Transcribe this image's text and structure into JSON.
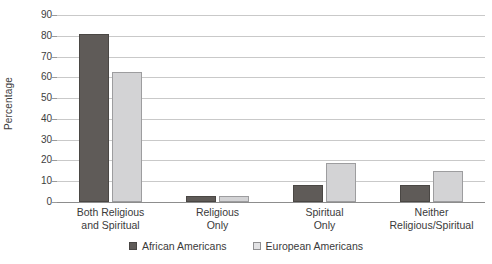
{
  "chart_data": {
    "type": "bar",
    "title": "",
    "xlabel": "",
    "ylabel": "Percentage",
    "ylim": [
      0,
      90
    ],
    "ytick_step": 10,
    "yticks": [
      "90",
      "80",
      "70",
      "60",
      "50",
      "40",
      "30",
      "20",
      "10",
      "0"
    ],
    "grid": true,
    "legend_position": "bottom",
    "categories": [
      "Both Religious\nand Spiritual",
      "Religious\nOnly",
      "Spiritual\nOnly",
      "Neither\nReligious/Spiritual"
    ],
    "category_lines": [
      [
        "Both Religious",
        "and Spiritual"
      ],
      [
        "Religious",
        "Only"
      ],
      [
        "Spiritual",
        "Only"
      ],
      [
        "Neither",
        "Religious/Spiritual"
      ]
    ],
    "series": [
      {
        "name": "African Americans",
        "color": "#5f5b58",
        "values": [
          81,
          3,
          8,
          8
        ]
      },
      {
        "name": "European Americans",
        "color": "#d3d3d5",
        "values": [
          62.5,
          3,
          19,
          15
        ]
      }
    ]
  },
  "colors": {
    "series_a": "#5f5b58",
    "series_b": "#d3d3d5",
    "gridline": "#c9c9c9",
    "axis": "#8d8d8d",
    "text": "#3a3a3a",
    "background": "#ffffff"
  }
}
